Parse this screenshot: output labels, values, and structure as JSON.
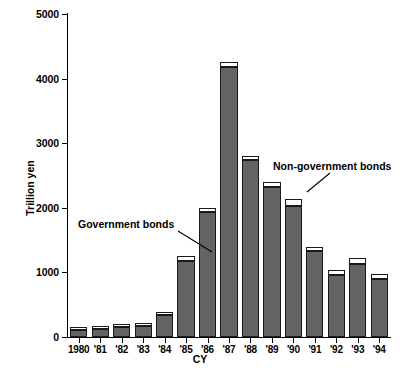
{
  "chart_data": {
    "type": "bar",
    "subtype": "stacked-vertical",
    "title": "",
    "xlabel": "CY",
    "ylabel": "Trillion yen",
    "ylim": [
      0,
      5000
    ],
    "yticks": [
      0,
      1000,
      2000,
      3000,
      4000,
      5000
    ],
    "ytick_labels": [
      "0",
      "1000",
      "2000",
      "3000",
      "4000",
      "5000"
    ],
    "grid": false,
    "legend": "annotated-inline",
    "categories": [
      "1980",
      "'81",
      "'82",
      "'83",
      "'84",
      "'85",
      "'86",
      "'87",
      "'88",
      "'89",
      "'90",
      "'91",
      "'92",
      "'93",
      "'94"
    ],
    "series": [
      {
        "name": "Government bonds",
        "color": "#636363",
        "values": [
          110,
          120,
          155,
          175,
          340,
          1180,
          1930,
          4180,
          2740,
          2320,
          2030,
          1330,
          960,
          1130,
          900
        ]
      },
      {
        "name": "Non-government bonds",
        "color": "#ffffff",
        "values": [
          20,
          20,
          25,
          25,
          30,
          70,
          70,
          70,
          60,
          80,
          110,
          70,
          70,
          100,
          80
        ]
      }
    ],
    "totals": [
      130,
      140,
      180,
      200,
      370,
      1250,
      2000,
      4250,
      2800,
      2400,
      2140,
      1400,
      1030,
      1230,
      980
    ],
    "annotations": [
      {
        "text": "Government bonds",
        "points_to": "'86 government-bond segment"
      },
      {
        "text": "Non-government bonds",
        "points_to": "'90 non-government-bond segment"
      }
    ]
  },
  "colors": {
    "government_bonds": "#636363",
    "non_government_bonds": "#ffffff",
    "axis": "#000000",
    "bar_outline": "#1a1a1a",
    "background": "#ffffff"
  }
}
